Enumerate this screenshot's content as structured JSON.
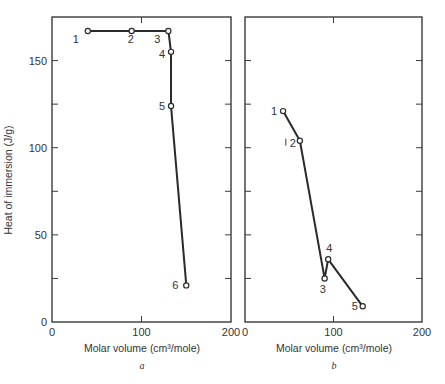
{
  "chart_data": [
    {
      "panel": "a",
      "type": "line",
      "xlabel": "Molar volume (cm³/mole)",
      "ylabel": "Heat of immersion (J/g)",
      "caption": "a",
      "xlim": [
        0,
        200
      ],
      "ylim": [
        0,
        175
      ],
      "xticks": [
        0,
        100,
        200
      ],
      "yticks": [
        0,
        50,
        100,
        150
      ],
      "grid": false,
      "points": [
        {
          "label": "1",
          "x": 40,
          "y": 167
        },
        {
          "label": "2",
          "x": 89,
          "y": 167
        },
        {
          "label": "3",
          "x": 130,
          "y": 167
        },
        {
          "label": "4",
          "x": 133,
          "y": 155
        },
        {
          "label": "5",
          "x": 133,
          "y": 124
        },
        {
          "label": "6",
          "x": 150,
          "y": 21
        }
      ]
    },
    {
      "panel": "b",
      "type": "line",
      "xlabel": "Molar volume (cm³/mole)",
      "ylabel": "",
      "caption": "b",
      "xlim": [
        0,
        200
      ],
      "ylim": [
        0,
        175
      ],
      "xticks": [
        0,
        100,
        200
      ],
      "yticks": [],
      "grid": false,
      "points": [
        {
          "label": "1",
          "x": 43,
          "y": 121
        },
        {
          "label": "2",
          "x": 62,
          "y": 104
        },
        {
          "label": "3",
          "x": 90,
          "y": 25
        },
        {
          "label": "4",
          "x": 94,
          "y": 36
        },
        {
          "label": "5",
          "x": 133,
          "y": 9
        }
      ]
    }
  ],
  "layout": {
    "panels": [
      {
        "x0": 52,
        "x1": 231,
        "y0": 322,
        "yTop": 17
      },
      {
        "x0": 245,
        "x1": 422,
        "y0": 322,
        "yTop": 17
      }
    ],
    "label_offsets": {
      "a": [
        [
          -15,
          12
        ],
        [
          -4,
          12
        ],
        [
          -14,
          12
        ],
        [
          -12,
          6
        ],
        [
          -12,
          4
        ],
        [
          -14,
          4
        ]
      ],
      "b": [
        [
          -12,
          4
        ],
        [
          -10,
          6
        ],
        [
          -5,
          15
        ],
        [
          -2,
          -7
        ],
        [
          -11,
          4
        ]
      ]
    }
  },
  "labels": {
    "ylabel": "Heat of immersion (J/g)",
    "xlabel_a": "Molar volume (cm³/mole)",
    "xlabel_b": "Molar volume (cm³/mole)",
    "caption_a": "a",
    "caption_b": "b"
  }
}
